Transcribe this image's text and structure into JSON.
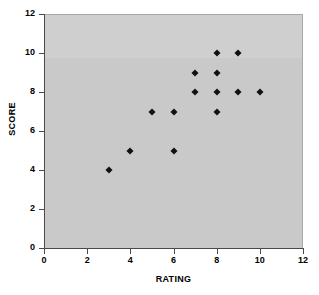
{
  "chart_data": {
    "type": "scatter",
    "title": "",
    "xlabel": "RATING",
    "ylabel": "SCORE",
    "xlim": [
      0,
      12
    ],
    "ylim": [
      0,
      12
    ],
    "xticks": [
      0,
      2,
      4,
      6,
      8,
      10,
      12
    ],
    "yticks": [
      0,
      2,
      4,
      6,
      8,
      10,
      12
    ],
    "grid": false,
    "legend": false,
    "marker": "diamond",
    "marker_color": "#111111",
    "plot_background": "#c9c9c9",
    "figure_background": "#ffffff",
    "axis_color": "#4a4a4a",
    "points": [
      {
        "x": 3,
        "y": 4
      },
      {
        "x": 4,
        "y": 5
      },
      {
        "x": 5,
        "y": 7
      },
      {
        "x": 6,
        "y": 5
      },
      {
        "x": 6,
        "y": 7
      },
      {
        "x": 7,
        "y": 8
      },
      {
        "x": 7,
        "y": 9
      },
      {
        "x": 8,
        "y": 7
      },
      {
        "x": 8,
        "y": 8
      },
      {
        "x": 8,
        "y": 9
      },
      {
        "x": 8,
        "y": 10
      },
      {
        "x": 9,
        "y": 8
      },
      {
        "x": 9,
        "y": 10
      },
      {
        "x": 10,
        "y": 8
      }
    ]
  }
}
